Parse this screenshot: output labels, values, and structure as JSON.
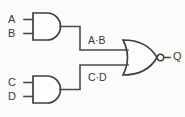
{
  "diagram": {
    "background_color": "#fbfbfa",
    "line_color": "#4a4a4a"
  },
  "inputs": [
    {
      "id": "A",
      "label": "A"
    },
    {
      "id": "B",
      "label": "B"
    },
    {
      "id": "C",
      "label": "C"
    },
    {
      "id": "D",
      "label": "D"
    }
  ],
  "gates": [
    {
      "id": "and1",
      "type": "AND",
      "inputs": [
        "A",
        "B"
      ],
      "output_label": "A·B"
    },
    {
      "id": "and2",
      "type": "AND",
      "inputs": [
        "C",
        "D"
      ],
      "output_label": "C·D"
    },
    {
      "id": "nor1",
      "type": "NOR",
      "inputs": [
        "A·B",
        "C·D"
      ],
      "output_label": "Q"
    }
  ],
  "nets": [
    {
      "id": "net-ab",
      "label": "A·B"
    },
    {
      "id": "net-cd",
      "label": "C·D"
    }
  ],
  "output": {
    "id": "Q",
    "label": "Q"
  }
}
